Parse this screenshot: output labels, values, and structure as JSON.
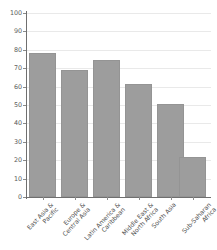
{
  "chart_data": {
    "type": "bar",
    "title": "",
    "subtitle": "",
    "xlabel": "",
    "ylabel": "",
    "ylim": [
      0,
      100
    ],
    "grid": true,
    "legend": "none",
    "orientation": "vertical",
    "bar_color": "#9d9d9d",
    "categories": [
      "East Asia & Pacific",
      "Europe & Central Asia",
      "Latin America & Caribbean",
      "Middle East & North Africa",
      "South Asia",
      "Sub-Saharan Africa"
    ],
    "category_lines": [
      [
        "East Asia &",
        "Pacific"
      ],
      [
        "Europe &",
        "Central Asia"
      ],
      [
        "Latin America &",
        "Caribbean"
      ],
      [
        "Middle East &",
        "North Africa"
      ],
      [
        "South Asia",
        ""
      ],
      [
        "Sub-Saharan",
        "Africa"
      ]
    ],
    "values": [
      78,
      69,
      74.5,
      61.5,
      50.5,
      21.5
    ],
    "yticks": [
      0,
      10,
      20,
      30,
      40,
      50,
      60,
      70,
      80,
      90,
      100
    ],
    "ytick_labels": [
      "0",
      "10",
      "20",
      "30",
      "40",
      "50",
      "60",
      "70",
      "80",
      "90",
      "100"
    ]
  },
  "axes": {
    "axis_color": "#6f6f6f",
    "grid_color": "#e9e9e9"
  }
}
